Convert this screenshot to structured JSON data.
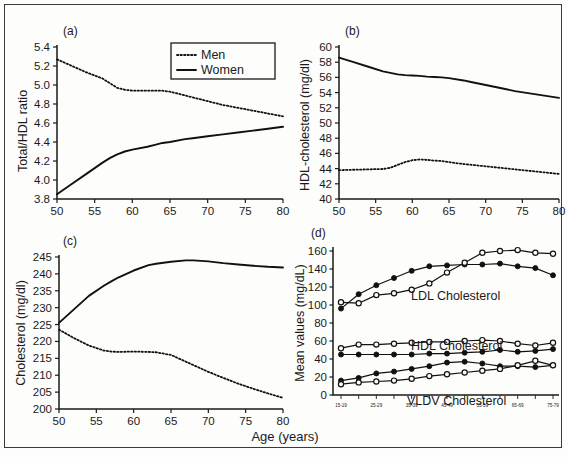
{
  "figure": {
    "shared_xaxis_title": "Age (years)",
    "legend": {
      "men_label": "Men",
      "women_label": "Women",
      "men_style": "dotted",
      "women_style": "solid"
    },
    "line_color": "#111111",
    "background": "#fdfdfb",
    "border_color": "#3a3a3a"
  },
  "chart_data": [
    {
      "type": "line",
      "panel": "(a)",
      "title": "",
      "xlabel": "Age (years)",
      "ylabel": "Total/HDL ratio",
      "xlim": [
        50,
        80
      ],
      "ylim": [
        3.8,
        5.4
      ],
      "xticks": [
        50,
        55,
        60,
        65,
        70,
        75,
        80
      ],
      "yticks": [
        3.8,
        4.0,
        4.2,
        4.4,
        4.6,
        4.8,
        5.0,
        5.2,
        5.4
      ],
      "grid": false,
      "legend_position": "top-right",
      "x": [
        50,
        52,
        54,
        56,
        57,
        58,
        59,
        60,
        62,
        63,
        64,
        65,
        67,
        68,
        70,
        72,
        74,
        76,
        78,
        80
      ],
      "series": [
        {
          "name": "Men",
          "style": "dotted",
          "values": [
            5.27,
            5.2,
            5.13,
            5.07,
            5.02,
            4.97,
            4.95,
            4.94,
            4.94,
            4.94,
            4.94,
            4.93,
            4.89,
            4.87,
            4.83,
            4.79,
            4.76,
            4.73,
            4.7,
            4.67
          ]
        },
        {
          "name": "Women",
          "style": "solid",
          "values": [
            3.85,
            3.96,
            4.07,
            4.18,
            4.23,
            4.27,
            4.3,
            4.32,
            4.35,
            4.37,
            4.39,
            4.4,
            4.43,
            4.44,
            4.46,
            4.48,
            4.5,
            4.52,
            4.54,
            4.56
          ]
        }
      ]
    },
    {
      "type": "line",
      "panel": "(b)",
      "title": "",
      "xlabel": "Age (years)",
      "ylabel": "HDL-cholesterol (mg/dl)",
      "xlim": [
        50,
        80
      ],
      "ylim": [
        40,
        60
      ],
      "xticks": [
        50,
        55,
        60,
        65,
        70,
        75,
        80
      ],
      "yticks": [
        40,
        42,
        44,
        46,
        48,
        50,
        52,
        54,
        56,
        58,
        60
      ],
      "grid": false,
      "x": [
        50,
        52,
        54,
        56,
        57,
        58,
        59,
        60,
        61,
        62,
        63,
        64,
        65,
        67,
        68,
        70,
        72,
        74,
        76,
        78,
        80
      ],
      "series": [
        {
          "name": "Women",
          "style": "solid",
          "values": [
            58.6,
            58.0,
            57.4,
            56.8,
            56.6,
            56.4,
            56.3,
            56.25,
            56.2,
            56.1,
            56.05,
            56.0,
            55.9,
            55.6,
            55.4,
            55.0,
            54.6,
            54.2,
            53.9,
            53.6,
            53.3
          ]
        },
        {
          "name": "Men",
          "style": "dotted",
          "values": [
            43.8,
            43.85,
            43.9,
            43.95,
            44.1,
            44.5,
            44.85,
            45.1,
            45.2,
            45.15,
            45.05,
            45.0,
            44.85,
            44.6,
            44.5,
            44.3,
            44.1,
            43.9,
            43.7,
            43.5,
            43.3
          ]
        }
      ]
    },
    {
      "type": "line",
      "panel": "(c)",
      "title": "",
      "xlabel": "Age (years)",
      "ylabel": "Cholesterol (mg/dl)",
      "xlim": [
        50,
        80
      ],
      "ylim": [
        200,
        245
      ],
      "xticks": [
        50,
        55,
        60,
        65,
        70,
        75,
        80
      ],
      "yticks": [
        200,
        205,
        210,
        215,
        220,
        225,
        230,
        235,
        240,
        245
      ],
      "grid": false,
      "x": [
        50,
        52,
        54,
        56,
        57,
        58,
        60,
        62,
        63,
        65,
        67,
        68,
        70,
        72,
        74,
        76,
        78,
        80
      ],
      "series": [
        {
          "name": "Women",
          "style": "solid",
          "values": [
            225.5,
            229.5,
            233.5,
            236.5,
            237.8,
            239.0,
            241.0,
            242.6,
            243.0,
            243.6,
            244.0,
            244.0,
            243.7,
            243.2,
            242.8,
            242.4,
            242.1,
            241.9
          ]
        },
        {
          "name": "Men",
          "style": "dotted",
          "values": [
            223.5,
            221.0,
            218.8,
            217.3,
            217.0,
            216.9,
            217.0,
            216.9,
            216.8,
            216.0,
            214.0,
            213.0,
            211.0,
            209.2,
            207.5,
            206.0,
            204.6,
            203.3
          ]
        }
      ]
    },
    {
      "type": "line",
      "panel": "(d)",
      "title": "",
      "xlabel": "",
      "ylabel": "Mean values (mg/dL)",
      "ylim": [
        0,
        160
      ],
      "yticks": [
        0,
        20,
        40,
        60,
        80,
        100,
        120,
        140,
        160
      ],
      "grid": false,
      "categories": [
        "15-19",
        "20-24",
        "25-29",
        "30-34",
        "35-39",
        "40-44",
        "45-49",
        "50-54",
        "55-59",
        "60-64",
        "65-69",
        "70-74",
        "75-79"
      ],
      "visible_xticklabels": [
        "15-19",
        "25-29",
        "35-39",
        "45-49",
        "55-59",
        "65-69",
        "75-79"
      ],
      "annotations": [
        "LDL Cholesterol",
        "HDL Cholesterol",
        "VLDV Cholesterol"
      ],
      "series": [
        {
          "name": "LDL Cholesterol - filled",
          "marker": "filled",
          "values": [
            96,
            112,
            122,
            130,
            138,
            143,
            144,
            145,
            145,
            146,
            143,
            141,
            133
          ]
        },
        {
          "name": "LDL Cholesterol - open",
          "marker": "open",
          "values": [
            103,
            102,
            111,
            113,
            117,
            124,
            136,
            147,
            158,
            160,
            161,
            158,
            157
          ]
        },
        {
          "name": "HDL Cholesterol - open",
          "marker": "open",
          "values": [
            52,
            56,
            56,
            57,
            58,
            59,
            59,
            60,
            61,
            60,
            57,
            55,
            58
          ]
        },
        {
          "name": "HDL Cholesterol - filled",
          "marker": "filled",
          "values": [
            45,
            45,
            45,
            45,
            45,
            46,
            46,
            47,
            48,
            50,
            48,
            49,
            51
          ]
        },
        {
          "name": "VLDV Cholesterol - filled",
          "marker": "filled",
          "values": [
            16,
            19,
            24,
            26,
            29,
            32,
            36,
            37,
            35,
            32,
            32,
            31,
            33
          ]
        },
        {
          "name": "VLDV Cholesterol - open",
          "marker": "open",
          "values": [
            12,
            14,
            15,
            16,
            18,
            21,
            23,
            25,
            27,
            29,
            33,
            38,
            33
          ]
        }
      ]
    }
  ]
}
